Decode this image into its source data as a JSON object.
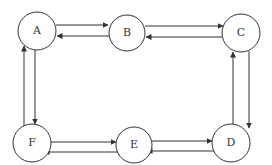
{
  "diagram": {
    "type": "directed-graph",
    "line_color": "#333333",
    "background": "#ffffff",
    "nodes": [
      {
        "id": "A",
        "label": "A",
        "cx": 37,
        "cy": 31,
        "r": 19
      },
      {
        "id": "B",
        "label": "B",
        "cx": 127,
        "cy": 33,
        "r": 18
      },
      {
        "id": "C",
        "label": "C",
        "cx": 241,
        "cy": 33,
        "r": 19
      },
      {
        "id": "D",
        "label": "D",
        "cx": 231,
        "cy": 143,
        "r": 19
      },
      {
        "id": "E",
        "label": "E",
        "cx": 134,
        "cy": 145,
        "r": 18
      },
      {
        "id": "F",
        "label": "F",
        "cx": 32,
        "cy": 143,
        "r": 19
      }
    ],
    "edges": [
      {
        "from": "A",
        "to": "B",
        "x1": 56,
        "y1": 25,
        "x2": 108,
        "y2": 25
      },
      {
        "from": "B",
        "to": "A",
        "x1": 109,
        "y1": 36,
        "x2": 57,
        "y2": 36
      },
      {
        "from": "B",
        "to": "C",
        "x1": 145,
        "y1": 26,
        "x2": 223,
        "y2": 26
      },
      {
        "from": "C",
        "to": "B",
        "x1": 222,
        "y1": 37,
        "x2": 146,
        "y2": 37
      },
      {
        "from": "A",
        "to": "F",
        "x1": 35,
        "y1": 50,
        "x2": 35,
        "y2": 124
      },
      {
        "from": "F",
        "to": "A",
        "x1": 24,
        "y1": 127,
        "x2": 24,
        "y2": 46
      },
      {
        "from": "C",
        "to": "D",
        "x1": 249,
        "y1": 51,
        "x2": 249,
        "y2": 128
      },
      {
        "from": "D",
        "to": "C",
        "x1": 233,
        "y1": 124,
        "x2": 233,
        "y2": 52
      },
      {
        "from": "F",
        "to": "E",
        "x1": 51,
        "y1": 142,
        "x2": 116,
        "y2": 142
      },
      {
        "from": "E",
        "to": "F",
        "x1": 118,
        "y1": 152,
        "x2": 44,
        "y2": 152
      },
      {
        "from": "E",
        "to": "D",
        "x1": 152,
        "y1": 141,
        "x2": 212,
        "y2": 141
      },
      {
        "from": "D",
        "to": "E",
        "x1": 214,
        "y1": 151,
        "x2": 147,
        "y2": 151
      }
    ]
  }
}
